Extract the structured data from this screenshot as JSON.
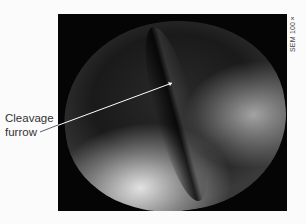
{
  "figure": {
    "annotation_label_line1": "Cleavage",
    "annotation_label_line2": "furrow",
    "magnification_label": "SEM 100×"
  }
}
